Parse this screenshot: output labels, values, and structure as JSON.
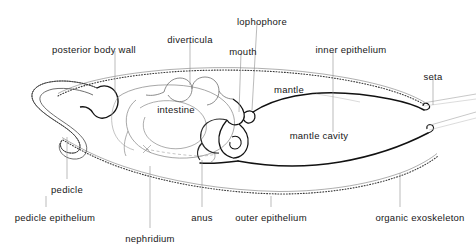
{
  "figure": {
    "type": "anatomical-diagram",
    "background_color": "#ffffff",
    "line_color": "#1a1a1a",
    "faint_line_color": "#8d8d8d",
    "label_color": "#171717",
    "label_font_size_px": 9.5
  },
  "labels": [
    {
      "id": "posterior-body-wall",
      "text": "posterior body wall",
      "x": 94,
      "y": 45,
      "anchor": "center",
      "leader": {
        "x1": 115,
        "y1": 51,
        "x2": 115,
        "y2": 93
      }
    },
    {
      "id": "diverticula",
      "text": "diverticula",
      "x": 190,
      "y": 35,
      "anchor": "center",
      "leader": {
        "x1": 190,
        "y1": 41,
        "x2": 190,
        "y2": 85
      }
    },
    {
      "id": "lophophore",
      "text": "lophophore",
      "x": 262,
      "y": 17,
      "anchor": "center",
      "leader": {
        "x1": 257,
        "y1": 23,
        "x2": 252,
        "y2": 110
      }
    },
    {
      "id": "mouth",
      "text": "mouth",
      "x": 243,
      "y": 47,
      "anchor": "center",
      "leader": {
        "x1": 241,
        "y1": 53,
        "x2": 239,
        "y2": 112
      }
    },
    {
      "id": "inner-epithelium",
      "text": "inner epithelium",
      "x": 351,
      "y": 45,
      "anchor": "center",
      "leader": {
        "x1": 333,
        "y1": 51,
        "x2": 333,
        "y2": 132
      }
    },
    {
      "id": "seta",
      "text": "seta",
      "x": 433,
      "y": 72,
      "anchor": "center",
      "leader": {
        "x1": 433,
        "y1": 78,
        "x2": 433,
        "y2": 105
      }
    },
    {
      "id": "mantle",
      "text": "mantle",
      "x": 289,
      "y": 85,
      "anchor": "center",
      "leader": null
    },
    {
      "id": "intestine",
      "text": "intestine",
      "x": 176,
      "y": 105,
      "anchor": "center",
      "leader": null
    },
    {
      "id": "mantle-cavity",
      "text": "mantle cavity",
      "x": 319,
      "y": 131,
      "anchor": "center",
      "leader": null
    },
    {
      "id": "pedicle",
      "text": "pedicle",
      "x": 67,
      "y": 185,
      "anchor": "center",
      "leader": {
        "x1": 67,
        "y1": 179,
        "x2": 67,
        "y2": 137
      }
    },
    {
      "id": "pedicle-epithelium",
      "text": "pedicle epithelium",
      "x": 55,
      "y": 213,
      "anchor": "center",
      "leader": {
        "x1": 46,
        "y1": 207,
        "x2": 46,
        "y2": 196
      }
    },
    {
      "id": "nephridium",
      "text": "nephridium",
      "x": 150,
      "y": 234,
      "anchor": "center",
      "leader": {
        "x1": 150,
        "y1": 228,
        "x2": 150,
        "y2": 166
      }
    },
    {
      "id": "anus",
      "text": "anus",
      "x": 202,
      "y": 213,
      "anchor": "center",
      "leader": {
        "x1": 202,
        "y1": 207,
        "x2": 202,
        "y2": 160
      }
    },
    {
      "id": "outer-epithelium",
      "text": "outer epithelium",
      "x": 271,
      "y": 213,
      "anchor": "center",
      "leader": {
        "x1": 271,
        "y1": 207,
        "x2": 271,
        "y2": 196
      }
    },
    {
      "id": "organic-exoskeleton",
      "text": "organic exoskeleton",
      "x": 420,
      "y": 213,
      "anchor": "center",
      "leader": {
        "x1": 400,
        "y1": 207,
        "x2": 400,
        "y2": 173
      }
    }
  ]
}
